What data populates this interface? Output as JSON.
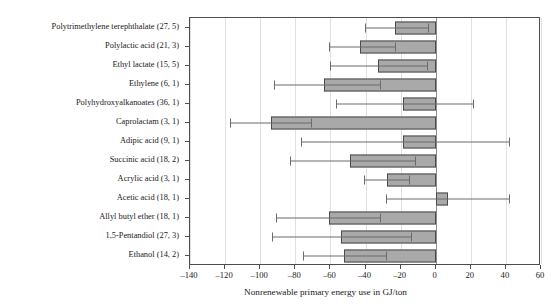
{
  "chart_data": {
    "type": "bar",
    "orientation": "horizontal",
    "title": "",
    "xlabel": "Nonrenewable primary energy use in GJ/ton",
    "ylabel": "",
    "xlim": [
      -140,
      60
    ],
    "xticks": [
      -140,
      -120,
      -100,
      -80,
      -60,
      -40,
      -20,
      0,
      20,
      40,
      60
    ],
    "xticklabels": [
      "–140",
      "–120",
      "–100",
      "–80",
      "–60",
      "–40",
      "–20",
      "0",
      "20",
      "40",
      "60"
    ],
    "grid": true,
    "legend": null,
    "zero_reference_line": 0,
    "categories": [
      "Polytrimethylene terephthalate (27, 5)",
      "Polylactic acid (21, 3)",
      "Ethyl lactate (15, 5)",
      "Ethylene (6, 1)",
      "Polyhydroxyalkanoates (36, 1)",
      "Caprolactam (3, 1)",
      "Adipic acid (9, 1)",
      "Succinic acid (18, 2)",
      "Acrylic acid (3, 1)",
      "Acetic acid (18, 1)",
      "Allyl butyl ether (18, 1)",
      "1,5-Pentandiol (27, 3)",
      "Ethanol (14, 2)"
    ],
    "values": [
      -23,
      -43,
      -33,
      -63.5,
      -18.5,
      -94,
      -18.5,
      -49,
      -28,
      7,
      -61,
      -54,
      -52
    ],
    "error_low": [
      -40.5,
      -61,
      -60,
      -92,
      -57,
      -117,
      -77,
      -83,
      -41,
      -28.5,
      -91,
      -93,
      -75.5
    ],
    "error_high": [
      -4.5,
      -23,
      -5,
      -32,
      21,
      -71,
      42,
      -12,
      -15,
      42,
      -32,
      -14,
      -28.5
    ],
    "series": [
      {
        "name": "Nonrenewable primary energy use",
        "values": [
          -23,
          -43,
          -33,
          -63.5,
          -18.5,
          -94,
          -18.5,
          -49,
          -28,
          7,
          -61,
          -54,
          -52
        ]
      }
    ],
    "colors": {
      "bar_fill": "#a9a9a9",
      "bar_edge": "#4a4a4a",
      "error_bar": "#6b6b6b",
      "grid": "#e0e0e0",
      "zero_line": "#8c8c8c",
      "frame": "#4d4d4d",
      "text": "#1a1a1a",
      "background": "#ffffff"
    }
  }
}
